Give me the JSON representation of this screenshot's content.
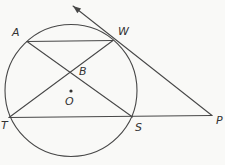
{
  "figure": {
    "background": "#f9f9f7",
    "line_color": "#474747",
    "label_color": "#333333",
    "width": 225,
    "height": 165,
    "circle": {
      "cx": 71,
      "cy": 90.5,
      "r": 66
    },
    "center": {
      "label": "O",
      "dot_x": 71,
      "dot_y": 91,
      "dot_r": 1.6,
      "label_x": 65,
      "label_y": 105
    },
    "points": [
      {
        "id": "A",
        "x": 27,
        "y": 41.5,
        "label_x": 12,
        "label_y": 35.5
      },
      {
        "id": "W",
        "x": 113,
        "y": 40.5,
        "label_x": 118,
        "label_y": 35
      },
      {
        "id": "B",
        "x": 71,
        "y": 71.8,
        "label_x": 79,
        "label_y": 75
      },
      {
        "id": "T",
        "x": 9,
        "y": 117.5,
        "label_x": 1,
        "label_y": 129
      },
      {
        "id": "S",
        "x": 132.5,
        "y": 117,
        "label_x": 135,
        "label_y": 131
      },
      {
        "id": "P",
        "x": 212,
        "y": 115.5,
        "label_x": 216,
        "label_y": 124
      }
    ],
    "segments": [
      {
        "name": "chord-AW",
        "from": "A",
        "to": "W"
      },
      {
        "name": "chord-AS",
        "from": "A",
        "to": "S"
      },
      {
        "name": "chord-TW",
        "from": "T",
        "to": "W"
      },
      {
        "name": "secant-TSP",
        "from": "T",
        "to": "P"
      }
    ],
    "tangent_ray": {
      "name": "tangent-ray-through-W",
      "from": "P",
      "through": "W",
      "tip_x": 73,
      "tip_y": 6
    }
  }
}
